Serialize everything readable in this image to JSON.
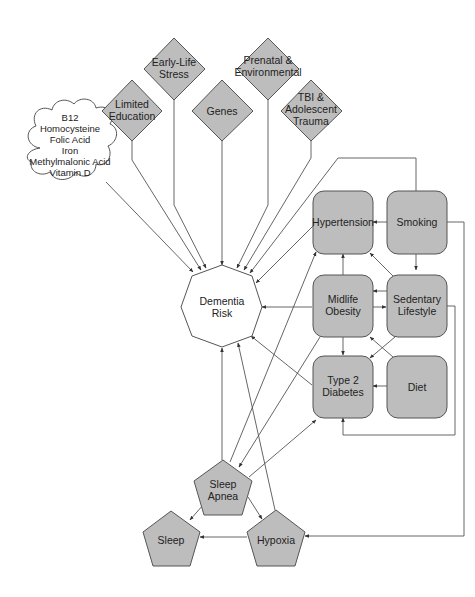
{
  "diagram": {
    "type": "causal-influence-diagram",
    "center": {
      "id": "dementia",
      "label_line1": "Dementia",
      "label_line2": "Risk",
      "shape": "octagon"
    },
    "diamond_factors": [
      {
        "id": "limited-education",
        "line1": "Limited",
        "line2": "Education"
      },
      {
        "id": "early-life-stress",
        "line1": "Early-Life",
        "line2": "Stress"
      },
      {
        "id": "genes",
        "line1": "Genes",
        "line2": ""
      },
      {
        "id": "prenatal-environmental",
        "line1": "Prenatal &",
        "line2": "Environmental"
      },
      {
        "id": "tbi-trauma",
        "line1": "TBI &",
        "line2": "Adolescent",
        "line3": "Trauma"
      }
    ],
    "cloud": {
      "id": "nutrients",
      "lines": [
        "B12",
        "Homocysteine",
        "Folic Acid",
        "Iron",
        "Methylmalonic Acid",
        "Vitamin D"
      ]
    },
    "rounded_factors": [
      {
        "id": "hypertension",
        "line1": "Hypertension",
        "line2": ""
      },
      {
        "id": "smoking",
        "line1": "Smoking",
        "line2": ""
      },
      {
        "id": "midlife-obesity",
        "line1": "Midlife",
        "line2": "Obesity"
      },
      {
        "id": "sedentary-lifestyle",
        "line1": "Sedentary",
        "line2": "Lifestyle"
      },
      {
        "id": "type2-diabetes",
        "line1": "Type 2",
        "line2": "Diabetes"
      },
      {
        "id": "diet",
        "line1": "Diet",
        "line2": ""
      }
    ],
    "pentagon_factors": [
      {
        "id": "sleep-apnea",
        "line1": "Sleep",
        "line2": "Apnea"
      },
      {
        "id": "sleep",
        "line1": "Sleep",
        "line2": ""
      },
      {
        "id": "hypoxia",
        "line1": "Hypoxia",
        "line2": ""
      }
    ],
    "edges": [
      {
        "from": "nutrients",
        "to": "dementia"
      },
      {
        "from": "limited-education",
        "to": "dementia"
      },
      {
        "from": "early-life-stress",
        "to": "dementia"
      },
      {
        "from": "genes",
        "to": "dementia"
      },
      {
        "from": "prenatal-environmental",
        "to": "dementia"
      },
      {
        "from": "tbi-trauma",
        "to": "dementia"
      },
      {
        "from": "smoking",
        "to": "dementia"
      },
      {
        "from": "hypertension",
        "to": "dementia"
      },
      {
        "from": "midlife-obesity",
        "to": "dementia"
      },
      {
        "from": "type2-diabetes",
        "to": "dementia"
      },
      {
        "from": "sleep-apnea",
        "to": "dementia"
      },
      {
        "from": "hypoxia",
        "to": "dementia"
      },
      {
        "from": "smoking",
        "to": "hypertension"
      },
      {
        "from": "smoking",
        "to": "sedentary-lifestyle"
      },
      {
        "from": "smoking",
        "to": "hypoxia"
      },
      {
        "from": "sedentary-lifestyle",
        "to": "hypertension"
      },
      {
        "from": "sedentary-lifestyle",
        "to": "midlife-obesity"
      },
      {
        "from": "midlife-obesity",
        "to": "sedentary-lifestyle"
      },
      {
        "from": "sedentary-lifestyle",
        "to": "type2-diabetes"
      },
      {
        "from": "sedentary-lifestyle",
        "to": "type2-diabetes",
        "routing": "right-loop"
      },
      {
        "from": "midlife-obesity",
        "to": "hypertension"
      },
      {
        "from": "midlife-obesity",
        "to": "type2-diabetes"
      },
      {
        "from": "midlife-obesity",
        "to": "sleep-apnea"
      },
      {
        "from": "diet",
        "to": "type2-diabetes"
      },
      {
        "from": "diet",
        "to": "midlife-obesity"
      },
      {
        "from": "sleep-apnea",
        "to": "hypertension"
      },
      {
        "from": "sleep-apnea",
        "to": "type2-diabetes"
      },
      {
        "from": "sleep-apnea",
        "to": "sleep"
      },
      {
        "from": "sleep-apnea",
        "to": "hypoxia"
      },
      {
        "from": "hypoxia",
        "to": "sleep"
      }
    ],
    "colors": {
      "node_fill": "#bdbdbd",
      "node_stroke": "#555555",
      "edge": "#555555",
      "background": "#ffffff"
    }
  }
}
